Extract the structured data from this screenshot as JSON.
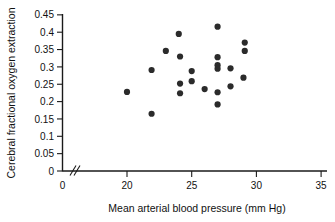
{
  "chart_data": {
    "type": "scatter",
    "title": "",
    "xlabel": "Mean arterial blood pressure (mm Hg)",
    "ylabel": "Cerebral fractional oxygen extraction",
    "xlim": [
      0,
      35
    ],
    "ylim": [
      0,
      0.45
    ],
    "axis_break_x": true,
    "grid": false,
    "legend": "none",
    "xticks": [
      0,
      20,
      25,
      30,
      35
    ],
    "xticklabels": [
      "0",
      "20",
      "25",
      "30",
      "35"
    ],
    "yticks": [
      0,
      0.05,
      0.1,
      0.15,
      0.2,
      0.25,
      0.3,
      0.35,
      0.4,
      0.45
    ],
    "yticklabels": [
      "0",
      "0.05",
      "0.1",
      "0.15",
      "0.2",
      "0.25",
      "0.3",
      "0.35",
      "0.4",
      "0.45"
    ],
    "marker": "filled-circle",
    "marker_color": "#2b2b2b",
    "points": [
      {
        "x": 20.0,
        "y": 0.228
      },
      {
        "x": 21.9,
        "y": 0.165
      },
      {
        "x": 21.9,
        "y": 0.291
      },
      {
        "x": 23.0,
        "y": 0.346
      },
      {
        "x": 24.0,
        "y": 0.395
      },
      {
        "x": 24.1,
        "y": 0.33
      },
      {
        "x": 24.1,
        "y": 0.252
      },
      {
        "x": 24.1,
        "y": 0.224
      },
      {
        "x": 25.0,
        "y": 0.288
      },
      {
        "x": 25.0,
        "y": 0.259
      },
      {
        "x": 26.0,
        "y": 0.236
      },
      {
        "x": 27.0,
        "y": 0.416
      },
      {
        "x": 27.0,
        "y": 0.328
      },
      {
        "x": 27.0,
        "y": 0.305
      },
      {
        "x": 27.0,
        "y": 0.295
      },
      {
        "x": 27.0,
        "y": 0.227
      },
      {
        "x": 27.0,
        "y": 0.192
      },
      {
        "x": 28.0,
        "y": 0.296
      },
      {
        "x": 28.0,
        "y": 0.244
      },
      {
        "x": 29.1,
        "y": 0.37
      },
      {
        "x": 29.1,
        "y": 0.346
      },
      {
        "x": 29.0,
        "y": 0.269
      }
    ]
  }
}
